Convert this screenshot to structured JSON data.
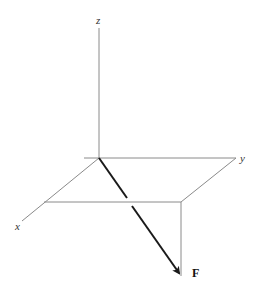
{
  "diagram": {
    "type": "3d-force-vector",
    "axes": {
      "z": {
        "label": "z"
      },
      "y": {
        "label": "y"
      },
      "x": {
        "label": "x"
      }
    },
    "vector": {
      "label": "F"
    },
    "colors": {
      "axis": "#8a8a8a",
      "construction": "#8a8a8a",
      "vector": "#1a1a1a",
      "background": "#ffffff"
    }
  }
}
